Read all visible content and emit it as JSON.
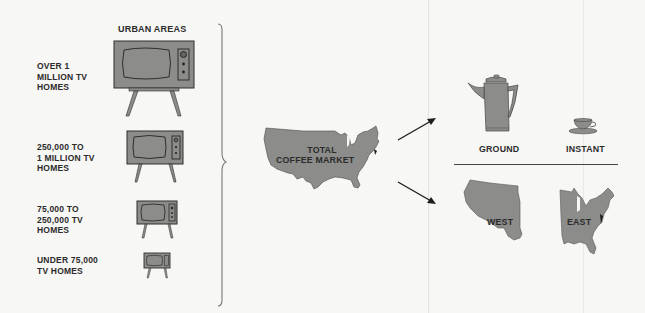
{
  "header": {
    "urban_areas": "URBAN AREAS"
  },
  "tv_tiers": [
    {
      "label_lines": [
        "OVER 1",
        "MILLION TV",
        "HOMES"
      ]
    },
    {
      "label_lines": [
        "250,000 TO",
        "1 MILLION TV",
        "HOMES"
      ]
    },
    {
      "label_lines": [
        "75,000 TO",
        "250,000 TV",
        "HOMES"
      ]
    },
    {
      "label_lines": [
        "UNDER 75,000",
        "TV HOMES"
      ]
    }
  ],
  "center": {
    "line1": "TOTAL",
    "line2": "COFFEE MARKET"
  },
  "segments": {
    "product": {
      "ground": "GROUND",
      "instant": "INSTANT"
    },
    "region": {
      "west": "WEST",
      "east": "EAST"
    }
  },
  "icons": {
    "tv": "tv-icon",
    "map": "usa-map-icon",
    "coffee_pot": "coffee-pot-icon",
    "cup": "cup-icon",
    "arrow": "arrow-icon",
    "brace": "brace-icon"
  },
  "colors": {
    "fill": "#8c8c8a",
    "stroke": "#2e2e2e",
    "background": "#f7f7f5"
  }
}
